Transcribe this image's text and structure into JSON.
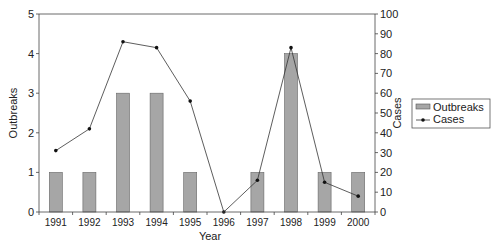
{
  "chart_data": {
    "type": "bar+line",
    "title": "",
    "xlabel": "Year",
    "ylabel_left": "Outbreaks",
    "ylabel_right": "Cases",
    "categories": [
      "1991",
      "1992",
      "1993",
      "1994",
      "1995",
      "1996",
      "1997",
      "1998",
      "1999",
      "2000"
    ],
    "series": [
      {
        "name": "Outbreaks",
        "type": "bar",
        "axis": "left",
        "values": [
          1,
          1,
          3,
          3,
          1,
          0,
          1,
          4,
          1,
          1
        ],
        "color": "#a6a6a6"
      },
      {
        "name": "Cases",
        "type": "line",
        "axis": "right",
        "values": [
          31,
          42,
          86,
          83,
          56,
          0,
          16,
          83,
          15,
          8
        ],
        "color": "#333333"
      }
    ],
    "ylim_left": [
      0,
      5
    ],
    "yticks_left": [
      "0",
      "1",
      "2",
      "3",
      "4",
      "5"
    ],
    "ylim_right": [
      0,
      100
    ],
    "yticks_right": [
      "0",
      "10",
      "20",
      "30",
      "40",
      "50",
      "60",
      "70",
      "80",
      "90",
      "100"
    ],
    "grid": false,
    "legend": {
      "position": "right",
      "entries": [
        "Outbreaks",
        "Cases"
      ]
    }
  }
}
